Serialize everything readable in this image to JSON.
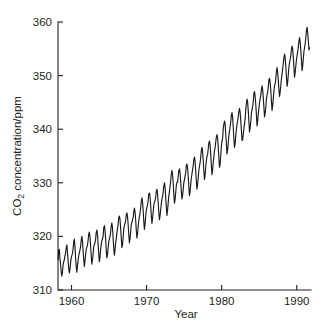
{
  "chart_data": {
    "type": "line",
    "title": "",
    "xlabel": "Year",
    "ylabel_parts": {
      "pre": "CO",
      "sub": "2",
      "post": " concentration/ppm"
    },
    "ylabel": "CO2 concentration/ppm",
    "xlim": [
      1958.2,
      1991.9
    ],
    "ylim": [
      310,
      360
    ],
    "xticks": [
      1960,
      1970,
      1980,
      1990
    ],
    "xticklabels": [
      "1960",
      "1970",
      "1980",
      "1990"
    ],
    "yticks": [
      310,
      320,
      330,
      340,
      350,
      360
    ],
    "yticklabels": [
      "310",
      "320",
      "330",
      "340",
      "350",
      "360"
    ],
    "grid": false,
    "legend": null,
    "series_name": "Mauna Loa monthly mean CO2",
    "annotations": [],
    "x": [
      1958.21,
      1958.29,
      1958.38,
      1958.46,
      1958.54,
      1958.63,
      1958.71,
      1958.79,
      1958.88,
      1958.96,
      1959.04,
      1959.13,
      1959.21,
      1959.29,
      1959.38,
      1959.46,
      1959.54,
      1959.63,
      1959.71,
      1959.79,
      1959.88,
      1959.96,
      1960.04,
      1960.13,
      1960.21,
      1960.29,
      1960.38,
      1960.46,
      1960.54,
      1960.63,
      1960.71,
      1960.79,
      1960.88,
      1960.96,
      1961.04,
      1961.13,
      1961.21,
      1961.29,
      1961.38,
      1961.46,
      1961.54,
      1961.63,
      1961.71,
      1961.79,
      1961.88,
      1961.96,
      1962.04,
      1962.13,
      1962.21,
      1962.29,
      1962.38,
      1962.46,
      1962.54,
      1962.63,
      1962.71,
      1962.79,
      1962.88,
      1962.96,
      1963.04,
      1963.13,
      1963.21,
      1963.29,
      1963.38,
      1963.46,
      1963.54,
      1963.63,
      1963.71,
      1963.79,
      1963.88,
      1963.96,
      1964.04,
      1964.13,
      1964.21,
      1964.29,
      1964.38,
      1964.46,
      1964.54,
      1964.63,
      1964.71,
      1964.79,
      1964.88,
      1964.96,
      1965.04,
      1965.13,
      1965.21,
      1965.29,
      1965.38,
      1965.46,
      1965.54,
      1965.63,
      1965.71,
      1965.79,
      1965.88,
      1965.96,
      1966.04,
      1966.13,
      1966.21,
      1966.29,
      1966.38,
      1966.46,
      1966.54,
      1966.63,
      1966.71,
      1966.79,
      1966.88,
      1966.96,
      1967.04,
      1967.13,
      1967.21,
      1967.29,
      1967.38,
      1967.46,
      1967.54,
      1967.63,
      1967.71,
      1967.79,
      1967.88,
      1967.96,
      1968.04,
      1968.13,
      1968.21,
      1968.29,
      1968.38,
      1968.46,
      1968.54,
      1968.63,
      1968.71,
      1968.79,
      1968.88,
      1968.96,
      1969.04,
      1969.13,
      1969.21,
      1969.29,
      1969.38,
      1969.46,
      1969.54,
      1969.63,
      1969.71,
      1969.79,
      1969.88,
      1969.96,
      1970.04,
      1970.13,
      1970.21,
      1970.29,
      1970.38,
      1970.46,
      1970.54,
      1970.63,
      1970.71,
      1970.79,
      1970.88,
      1970.96,
      1971.04,
      1971.13,
      1971.21,
      1971.29,
      1971.38,
      1971.46,
      1971.54,
      1971.63,
      1971.71,
      1971.79,
      1971.88,
      1971.96,
      1972.04,
      1972.13,
      1972.21,
      1972.29,
      1972.38,
      1972.46,
      1972.54,
      1972.63,
      1972.71,
      1972.79,
      1972.88,
      1972.96,
      1973.04,
      1973.13,
      1973.21,
      1973.29,
      1973.38,
      1973.46,
      1973.54,
      1973.63,
      1973.71,
      1973.79,
      1973.88,
      1973.96,
      1974.04,
      1974.13,
      1974.21,
      1974.29,
      1974.38,
      1974.46,
      1974.54,
      1974.63,
      1974.71,
      1974.79,
      1974.88,
      1974.96,
      1975.04,
      1975.13,
      1975.21,
      1975.29,
      1975.38,
      1975.46,
      1975.54,
      1975.63,
      1975.71,
      1975.79,
      1975.88,
      1975.96,
      1976.04,
      1976.13,
      1976.21,
      1976.29,
      1976.38,
      1976.46,
      1976.54,
      1976.63,
      1976.71,
      1976.79,
      1976.88,
      1976.96,
      1977.04,
      1977.13,
      1977.21,
      1977.29,
      1977.38,
      1977.46,
      1977.54,
      1977.63,
      1977.71,
      1977.79,
      1977.88,
      1977.96,
      1978.04,
      1978.13,
      1978.21,
      1978.29,
      1978.38,
      1978.46,
      1978.54,
      1978.63,
      1978.71,
      1978.79,
      1978.88,
      1978.96,
      1979.04,
      1979.13,
      1979.21,
      1979.29,
      1979.38,
      1979.46,
      1979.54,
      1979.63,
      1979.71,
      1979.79,
      1979.88,
      1979.96,
      1980.04,
      1980.13,
      1980.21,
      1980.29,
      1980.38,
      1980.46,
      1980.54,
      1980.63,
      1980.71,
      1980.79,
      1980.88,
      1980.96,
      1981.04,
      1981.13,
      1981.21,
      1981.29,
      1981.38,
      1981.46,
      1981.54,
      1981.63,
      1981.71,
      1981.79,
      1981.88,
      1981.96,
      1982.04,
      1982.13,
      1982.21,
      1982.29,
      1982.38,
      1982.46,
      1982.54,
      1982.63,
      1982.71,
      1982.79,
      1982.88,
      1982.96,
      1983.04,
      1983.13,
      1983.21,
      1983.29,
      1983.38,
      1983.46,
      1983.54,
      1983.63,
      1983.71,
      1983.79,
      1983.88,
      1983.96,
      1984.04,
      1984.13,
      1984.21,
      1984.29,
      1984.38,
      1984.46,
      1984.54,
      1984.63,
      1984.71,
      1984.79,
      1984.88,
      1984.96,
      1985.04,
      1985.13,
      1985.21,
      1985.29,
      1985.38,
      1985.46,
      1985.54,
      1985.63,
      1985.71,
      1985.79,
      1985.88,
      1985.96,
      1986.04,
      1986.13,
      1986.21,
      1986.29,
      1986.38,
      1986.46,
      1986.54,
      1986.63,
      1986.71,
      1986.79,
      1986.88,
      1986.96,
      1987.04,
      1987.13,
      1987.21,
      1987.29,
      1987.38,
      1987.46,
      1987.54,
      1987.63,
      1987.71,
      1987.79,
      1987.88,
      1987.96,
      1988.04,
      1988.13,
      1988.21,
      1988.29,
      1988.38,
      1988.46,
      1988.54,
      1988.63,
      1988.71,
      1988.79,
      1988.88,
      1988.96,
      1989.04,
      1989.13,
      1989.21,
      1989.29,
      1989.38,
      1989.46,
      1989.54,
      1989.63,
      1989.71,
      1989.79,
      1989.88,
      1989.96,
      1990.04,
      1990.13,
      1990.21,
      1990.29,
      1990.38,
      1990.46,
      1990.54,
      1990.63,
      1990.71,
      1990.79,
      1990.88,
      1990.96,
      1991.04,
      1991.13,
      1991.21,
      1991.29,
      1991.38,
      1991.46,
      1991.54,
      1991.63,
      1991.71
    ],
    "y": [
      315.7,
      317.4,
      317.6,
      315.9,
      314.8,
      313.3,
      312.6,
      313.3,
      314.7,
      315.3,
      315.6,
      316.4,
      316.9,
      317.8,
      318.4,
      317.1,
      315.5,
      314.0,
      313.2,
      313.9,
      315.1,
      316.0,
      316.4,
      316.9,
      317.6,
      319.0,
      319.5,
      318.1,
      316.0,
      314.3,
      313.3,
      314.5,
      315.6,
      316.4,
      316.9,
      317.5,
      318.1,
      319.3,
      320.0,
      319.2,
      317.4,
      315.6,
      314.4,
      315.4,
      316.6,
      317.6,
      318.0,
      318.4,
      319.3,
      320.4,
      320.8,
      319.9,
      318.3,
      316.3,
      314.8,
      315.6,
      316.8,
      318.0,
      318.5,
      318.8,
      319.5,
      320.7,
      321.2,
      320.3,
      318.6,
      316.7,
      315.3,
      316.1,
      317.5,
      318.5,
      319.2,
      319.5,
      320.1,
      321.6,
      322.0,
      321.2,
      319.6,
      317.3,
      316.0,
      316.6,
      317.9,
      319.0,
      319.5,
      320.0,
      320.7,
      322.0,
      322.5,
      321.6,
      319.8,
      317.7,
      316.5,
      317.4,
      318.8,
      319.6,
      320.6,
      321.5,
      322.2,
      323.5,
      323.8,
      323.2,
      321.6,
      319.6,
      317.9,
      318.4,
      319.9,
      321.4,
      322.0,
      322.4,
      322.9,
      324.0,
      324.4,
      323.7,
      322.3,
      320.3,
      318.8,
      319.5,
      320.9,
      322.2,
      322.6,
      323.1,
      323.5,
      324.6,
      325.3,
      324.6,
      323.2,
      321.1,
      319.7,
      320.4,
      321.9,
      323.0,
      323.6,
      324.4,
      325.3,
      326.5,
      327.2,
      326.5,
      325.0,
      322.8,
      321.3,
      322.2,
      323.7,
      324.8,
      325.4,
      325.9,
      326.6,
      327.9,
      328.1,
      327.4,
      325.9,
      323.9,
      322.4,
      323.3,
      324.6,
      325.8,
      326.4,
      326.7,
      327.3,
      328.4,
      328.8,
      328.0,
      326.4,
      324.5,
      323.1,
      323.8,
      325.0,
      326.1,
      326.9,
      327.5,
      328.3,
      329.4,
      330.0,
      329.2,
      327.4,
      325.5,
      323.9,
      324.8,
      326.3,
      327.5,
      328.3,
      329.3,
      330.4,
      331.6,
      332.3,
      331.6,
      330.1,
      327.9,
      326.2,
      326.8,
      328.2,
      329.5,
      330.1,
      330.1,
      331.2,
      332.2,
      332.6,
      331.9,
      330.2,
      328.4,
      327.0,
      327.6,
      328.8,
      330.0,
      330.6,
      331.3,
      331.9,
      333.2,
      333.5,
      332.8,
      331.3,
      329.3,
      327.6,
      328.3,
      329.7,
      330.9,
      331.6,
      332.5,
      333.2,
      334.4,
      334.8,
      334.0,
      332.3,
      330.2,
      328.8,
      329.6,
      331.0,
      332.3,
      333.0,
      333.8,
      334.7,
      336.0,
      336.6,
      335.9,
      334.3,
      332.2,
      330.6,
      331.4,
      332.9,
      334.1,
      334.9,
      335.3,
      336.3,
      337.4,
      337.8,
      337.0,
      335.4,
      333.2,
      331.5,
      332.4,
      333.8,
      334.9,
      335.9,
      336.6,
      337.6,
      338.5,
      339.0,
      338.3,
      336.7,
      334.7,
      332.9,
      333.4,
      335.1,
      336.7,
      337.8,
      338.3,
      340.1,
      340.9,
      341.5,
      341.0,
      339.1,
      337.3,
      335.4,
      336.1,
      337.5,
      338.8,
      339.6,
      340.5,
      341.3,
      342.6,
      343.1,
      342.2,
      340.4,
      338.2,
      336.6,
      337.3,
      338.8,
      340.0,
      340.9,
      341.5,
      342.3,
      343.2,
      343.9,
      343.2,
      341.7,
      339.8,
      337.9,
      338.0,
      339.1,
      340.1,
      341.0,
      342.0,
      343.6,
      344.8,
      345.6,
      345.0,
      343.5,
      341.4,
      339.5,
      340.2,
      341.4,
      342.9,
      343.6,
      344.3,
      345.1,
      346.7,
      347.0,
      346.1,
      344.7,
      342.7,
      340.6,
      341.4,
      342.9,
      344.0,
      344.9,
      345.7,
      346.3,
      347.4,
      348.1,
      347.4,
      346.0,
      344.0,
      342.3,
      342.9,
      344.2,
      345.6,
      346.3,
      346.9,
      347.9,
      349.2,
      349.5,
      348.7,
      347.3,
      345.2,
      343.5,
      344.4,
      345.8,
      347.1,
      348.1,
      348.5,
      349.4,
      350.8,
      351.5,
      350.6,
      349.3,
      347.3,
      346.1,
      346.9,
      348.2,
      349.4,
      350.2,
      351.3,
      352.3,
      353.4,
      354.0,
      353.3,
      351.8,
      349.7,
      348.0,
      348.7,
      350.2,
      351.6,
      352.4,
      353.1,
      353.7,
      354.9,
      355.5,
      355.0,
      353.4,
      351.4,
      349.7,
      350.6,
      351.8,
      353.0,
      353.7,
      354.5,
      355.3,
      356.4,
      357.1,
      356.2,
      354.8,
      352.9,
      350.9,
      351.8,
      353.2,
      354.5,
      355.2,
      356.0,
      357.1,
      358.4,
      359.0,
      358.0,
      356.6,
      354.8,
      355.2
    ]
  },
  "axes": {
    "ylabel_pre": "CO",
    "ylabel_sub": "2",
    "ylabel_post": " concentration/ppm",
    "xlabel": "Year"
  },
  "colors": {
    "line": "#1a1a1a",
    "axis": "#231f20",
    "background": "#ffffff"
  }
}
